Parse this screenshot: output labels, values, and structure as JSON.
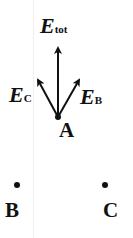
{
  "diagram": {
    "title": "",
    "colors": {
      "ink": "#111111",
      "background": "#ffffff"
    },
    "points": [
      {
        "id": "A",
        "label": "A",
        "x": 58,
        "y": 117
      },
      {
        "id": "B",
        "label": "B",
        "x": 17,
        "y": 185
      },
      {
        "id": "C",
        "label": "C",
        "x": 105,
        "y": 185
      }
    ],
    "vectors": [
      {
        "id": "E_tot",
        "symbol": "E",
        "subscript": "tot",
        "from": "A",
        "to": [
          58,
          46
        ]
      },
      {
        "id": "E_C",
        "symbol": "E",
        "subscript": "C",
        "from": "A",
        "to": [
          37,
          78
        ]
      },
      {
        "id": "E_B",
        "symbol": "E",
        "subscript": "B",
        "from": "A",
        "to": [
          80,
          78
        ]
      }
    ]
  }
}
